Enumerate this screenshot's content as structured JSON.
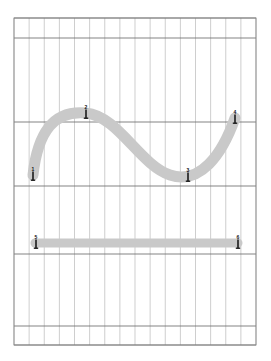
{
  "canvas": {
    "width": 271,
    "height": 361,
    "background_color": "#ffffff",
    "title": "Vector stroke canvas with grid"
  },
  "grid": {
    "left": 14,
    "top": 18,
    "right": 256,
    "bottom": 345,
    "columns": 16,
    "column_step": 15.1,
    "minor_color": "#b9b9b9",
    "major_color": "#6e6e6e",
    "frame_color": "#8a8a8a",
    "major_rows_y": [
      18,
      38,
      122,
      186,
      254,
      326,
      345
    ],
    "row_bands": 5
  },
  "strokes": [
    {
      "id": "sine-stroke",
      "name": "s-curve-stroke",
      "color": "#c9c9c9",
      "width": 11,
      "path": "M 33 175 C 38 130, 55 110, 86 113 C 118 116, 140 165, 170 175 C 200 185, 222 155, 235 118"
    },
    {
      "id": "bar-stroke",
      "name": "horizontal-bar-stroke",
      "color": "#c9c9c9",
      "width": 9,
      "path": "M 35 243 L 238 243"
    }
  ],
  "markers": [
    {
      "label": "1",
      "x": 33,
      "y": 175,
      "stroke": "sine-stroke"
    },
    {
      "label": "2",
      "x": 86,
      "y": 113,
      "stroke": "sine-stroke"
    },
    {
      "label": "3",
      "x": 188,
      "y": 176,
      "stroke": "sine-stroke"
    },
    {
      "label": "4",
      "x": 235,
      "y": 118,
      "stroke": "sine-stroke"
    },
    {
      "label": "5",
      "x": 36,
      "y": 243,
      "stroke": "bar-stroke"
    },
    {
      "label": "6",
      "x": 238,
      "y": 243,
      "stroke": "bar-stroke"
    }
  ]
}
